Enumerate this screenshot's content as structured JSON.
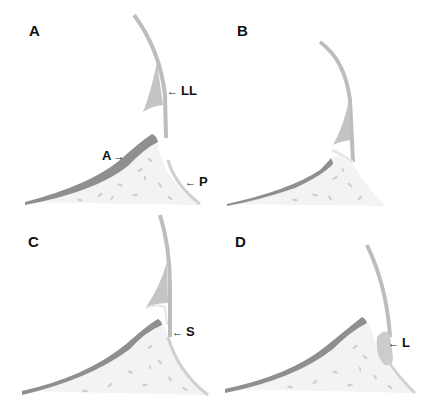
{
  "figure": {
    "panels": [
      {
        "id": "A",
        "label": "A",
        "annotations": [
          {
            "text": "LL",
            "meaning": "lateral lip"
          },
          {
            "text": "A",
            "meaning": "anterior"
          },
          {
            "text": "P",
            "meaning": "posterior"
          }
        ]
      },
      {
        "id": "B",
        "label": "B",
        "annotations": []
      },
      {
        "id": "C",
        "label": "C",
        "annotations": [
          {
            "text": "S"
          }
        ]
      },
      {
        "id": "D",
        "label": "D",
        "annotations": [
          {
            "text": "L"
          }
        ]
      }
    ]
  },
  "colors": {
    "background": "#ffffff",
    "membrane": "#bdbdbd",
    "bone_fill": "#f2f2f2",
    "cortex": "#8c8c8c",
    "lacunae": "#c8c8c8",
    "label": "#111111"
  }
}
